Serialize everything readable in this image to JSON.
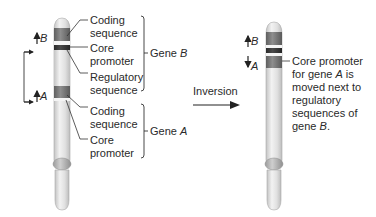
{
  "colors": {
    "chromosome_body": "#e4e4e4",
    "chromosome_shade": "#c8c8c8",
    "coding_band": "#7d7d7d",
    "promoter_band": "#3a3a3a",
    "regulatory_band": "#e9e9e9",
    "line": "#333333"
  },
  "left_chromosome": {
    "gene_b_marker": "B",
    "gene_a_marker": "A",
    "labels": {
      "coding_b_line1": "Coding",
      "coding_b_line2": "sequence",
      "core_b_line1": "Core",
      "core_b_line2": "promoter",
      "regulatory_line1": "Regulatory",
      "regulatory_line2": "sequence",
      "coding_a_line1": "Coding",
      "coding_a_line2": "sequence",
      "core_a_line1": "Core",
      "core_a_line2": "promoter"
    },
    "gene_b_bracket_label": "Gene ",
    "gene_b_bracket_italic": "B",
    "gene_a_bracket_label": "Gene ",
    "gene_a_bracket_italic": "A"
  },
  "arrow": {
    "label": "Inversion"
  },
  "right_chromosome": {
    "gene_b_marker": "B",
    "gene_a_marker": "A",
    "note": {
      "line1": "Core promoter",
      "line2_pre": "for gene ",
      "line2_italic": "A",
      "line2_post": " is",
      "line3": "moved next to",
      "line4": "regulatory",
      "line5": "sequences of",
      "line6_pre": "gene ",
      "line6_italic": "B",
      "line6_post": "."
    }
  }
}
